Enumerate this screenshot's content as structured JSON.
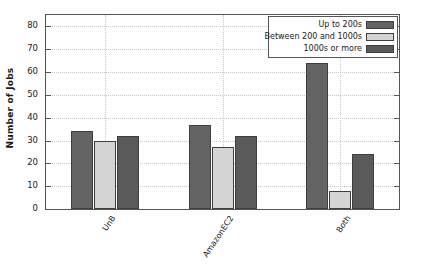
{
  "chart_data": {
    "type": "bar",
    "title": "",
    "xlabel": "",
    "ylabel": "Number of Jobs",
    "categories": [
      "UnB",
      "AmazonEC2",
      "Both"
    ],
    "ylim": [
      0,
      85
    ],
    "yticks": [
      0,
      10,
      20,
      30,
      40,
      50,
      60,
      70,
      80
    ],
    "ytick_labels": [
      "0",
      "10",
      "20",
      "30",
      "40",
      "50",
      "60",
      "70",
      "80"
    ],
    "grid": true,
    "legend_position": "upper right",
    "series": [
      {
        "name": "Up to 200s",
        "values": [
          34,
          37,
          64
        ],
        "color": "#636363"
      },
      {
        "name": "Between 200 and 1000s",
        "values": [
          30,
          27,
          8
        ],
        "color": "#d4d4d4"
      },
      {
        "name": "1000s or more",
        "values": [
          32,
          32,
          24
        ],
        "color": "#5a5a5a"
      }
    ]
  },
  "axes": {
    "frame_color": "#555555",
    "grid_color": "#c8c8c8",
    "background": "#ffffff"
  }
}
